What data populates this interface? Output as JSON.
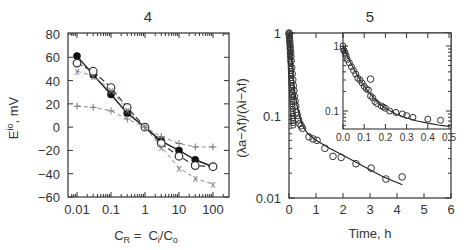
{
  "chart_data": [
    {
      "id": "chart4",
      "type": "line",
      "title": "4",
      "xlabel": "C_R = C_i/C_o",
      "ylabel": "E^io, mV",
      "xscale": "log",
      "xlim": [
        0.006,
        250
      ],
      "ylim": [
        -60,
        80
      ],
      "xticks": [
        0.01,
        0.1,
        1,
        10,
        100
      ],
      "xtick_labels": [
        "0.01",
        "0.1",
        "1",
        "10",
        "100"
      ],
      "yticks": [
        -60,
        -40,
        -20,
        0,
        20,
        40,
        60,
        80
      ],
      "ytick_labels": [
        "-60",
        "-40",
        "-20",
        "0",
        "20",
        "40",
        "60",
        "80"
      ],
      "grid": false,
      "x": [
        0.01,
        0.03,
        0.1,
        0.3,
        1,
        3,
        10,
        30,
        100
      ],
      "series": [
        {
          "name": "filled circles",
          "marker": "filled-circle",
          "line": "solid",
          "values": [
            61,
            45,
            28,
            12,
            0,
            -12,
            -20,
            -28,
            -34
          ]
        },
        {
          "name": "open circles",
          "marker": "open-circle",
          "line": "dashed",
          "values": [
            55,
            48,
            34,
            17,
            0,
            -14,
            -25,
            -33,
            -34
          ]
        },
        {
          "name": "crosses x",
          "marker": "x",
          "line": "dashed-gray",
          "values": [
            48,
            44,
            32,
            15,
            0,
            -17,
            -35,
            -44,
            -49
          ]
        },
        {
          "name": "plus",
          "marker": "plus",
          "line": "dashed-gray",
          "values": [
            18,
            17,
            14,
            7,
            0,
            -8,
            -14,
            -17,
            -17
          ]
        }
      ]
    },
    {
      "id": "chart5",
      "type": "scatter",
      "title": "5",
      "xlabel": "Time, h",
      "ylabel": "(λa−λf)/(λi−λf)",
      "yscale": "log",
      "xlim": [
        0,
        6
      ],
      "ylim": [
        0.01,
        1
      ],
      "xticks": [
        0,
        1,
        2,
        3,
        4,
        5,
        6
      ],
      "xtick_labels": [
        "0",
        "1",
        "2",
        "3",
        "4",
        "5",
        "6"
      ],
      "yticks": [
        0.01,
        0.1,
        1
      ],
      "ytick_labels": [
        "0.01",
        "0.1",
        "1"
      ],
      "grid": false,
      "points": {
        "x": [
          0.0,
          0.01,
          0.02,
          0.03,
          0.04,
          0.05,
          0.06,
          0.07,
          0.08,
          0.1,
          0.12,
          0.14,
          0.16,
          0.18,
          0.2,
          0.22,
          0.25,
          0.28,
          0.31,
          0.35,
          0.4,
          0.45,
          0.5,
          0.74,
          0.89,
          1.04,
          1.33,
          1.63,
          1.93,
          2.48,
          3.04,
          3.59,
          4.19
        ],
        "y": [
          1.0,
          0.95,
          0.88,
          0.8,
          0.72,
          0.65,
          0.58,
          0.52,
          0.46,
          0.38,
          0.32,
          0.27,
          0.23,
          0.2,
          0.17,
          0.15,
          0.13,
          0.11,
          0.1,
          0.09,
          0.08,
          0.075,
          0.07,
          0.055,
          0.052,
          0.05,
          0.04,
          0.032,
          0.031,
          0.026,
          0.023,
          0.017,
          0.018
        ]
      },
      "fit_line": {
        "x": [
          0.0,
          0.05,
          0.1,
          0.15,
          0.2,
          0.3,
          0.4,
          0.5,
          0.7,
          1.0,
          1.5,
          2.0,
          2.5,
          3.0,
          3.5,
          4.2
        ],
        "y": [
          1.0,
          0.7,
          0.45,
          0.3,
          0.21,
          0.13,
          0.095,
          0.075,
          0.06,
          0.05,
          0.04,
          0.033,
          0.027,
          0.022,
          0.018,
          0.0145
        ]
      },
      "inset": {
        "xscale": "linear",
        "yscale": "log",
        "xlim": [
          0,
          0.5
        ],
        "ylim": [
          0.053,
          1.6
        ],
        "xticks": [
          0.0,
          0.1,
          0.2,
          0.3,
          0.4,
          0.5
        ],
        "xtick_labels": [
          "0.0",
          "0.1",
          "0.2",
          "0.3",
          "0.4",
          "0.5"
        ],
        "yticks": [
          0.1,
          1
        ],
        "ytick_labels": [
          "0.1",
          "1"
        ],
        "points": {
          "x": [
            0.0,
            0.0,
            0.005,
            0.01,
            0.015,
            0.02,
            0.03,
            0.04,
            0.05,
            0.06,
            0.07,
            0.08,
            0.09,
            0.1,
            0.11,
            0.12,
            0.13,
            0.14,
            0.15,
            0.16,
            0.18,
            0.19,
            0.2,
            0.22,
            0.25,
            0.28,
            0.3,
            0.33,
            0.4,
            0.46
          ],
          "y": [
            1.0,
            0.9,
            0.85,
            0.78,
            0.7,
            0.62,
            0.55,
            0.48,
            0.42,
            0.37,
            0.32,
            0.3,
            0.27,
            0.24,
            0.22,
            0.21,
            0.17,
            0.16,
            0.14,
            0.13,
            0.12,
            0.115,
            0.11,
            0.1,
            0.095,
            0.09,
            0.085,
            0.08,
            0.075,
            0.072
          ]
        },
        "fit_line": {
          "x": [
            0.0,
            0.02,
            0.05,
            0.08,
            0.1,
            0.13,
            0.16,
            0.2,
            0.25,
            0.3,
            0.35,
            0.4,
            0.45,
            0.5
          ],
          "y": [
            1.0,
            0.7,
            0.45,
            0.3,
            0.24,
            0.18,
            0.14,
            0.11,
            0.09,
            0.078,
            0.07,
            0.065,
            0.061,
            0.058
          ]
        }
      }
    }
  ],
  "labels": {
    "chart4_title": "4",
    "chart5_title": "5",
    "chart4_xlabel_main": "C",
    "chart4_xlabel_sub": "R",
    "chart4_xlabel_eq": " =  C",
    "chart4_xlabel_sub2": "i",
    "chart4_xlabel_slash": "/C",
    "chart4_xlabel_sub3": "o",
    "chart4_ylabel_main": "E",
    "chart4_ylabel_sup": "io",
    "chart4_ylabel_unit": ", mV",
    "chart5_xlabel": "Time,  h",
    "chart5_ylabel": "(λa−λf)/(λi−λf)"
  }
}
